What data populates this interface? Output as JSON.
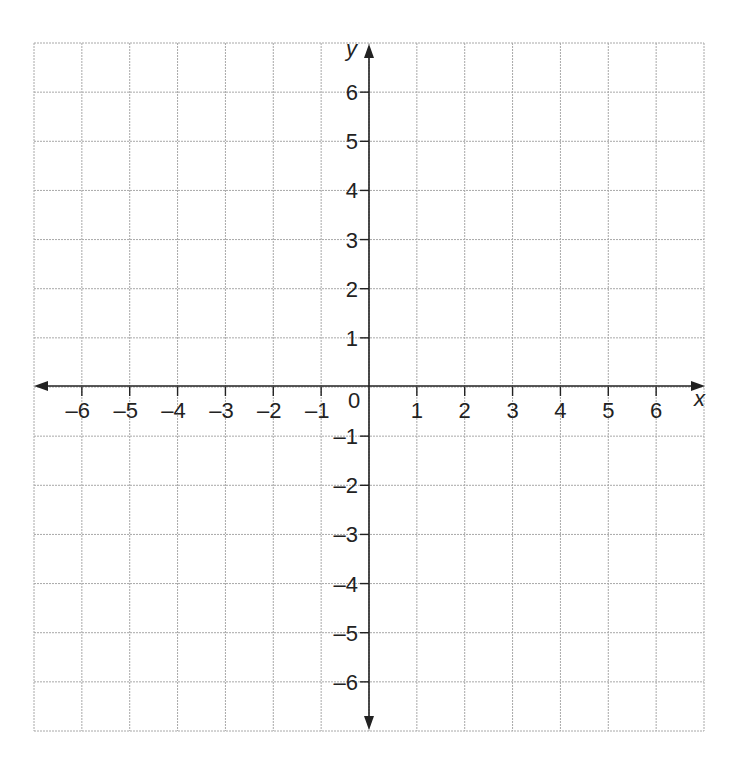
{
  "chart_data": {
    "type": "scatter",
    "title": "",
    "xlabel": "x",
    "ylabel": "y",
    "xlim": [
      -7,
      7
    ],
    "ylim": [
      -7,
      7
    ],
    "grid": true,
    "x_ticks": [
      -6,
      -5,
      -4,
      -3,
      -2,
      -1,
      1,
      2,
      3,
      4,
      5,
      6
    ],
    "y_ticks": [
      6,
      5,
      4,
      3,
      2,
      1,
      -1,
      -2,
      -3,
      -4,
      -5,
      -6
    ],
    "x_tick_labels": [
      "–6",
      "–5",
      "–4",
      "–3",
      "–2",
      "–1",
      "1",
      "2",
      "3",
      "4",
      "5",
      "6"
    ],
    "y_tick_labels": [
      "6",
      "5",
      "4",
      "3",
      "2",
      "1",
      "–1",
      "–2",
      "–3",
      "–4",
      "–5",
      "–6"
    ],
    "origin_label": "0",
    "series": []
  },
  "colors": {
    "grid": "#a8a8a8",
    "axis": "#222222",
    "background": "#ffffff"
  }
}
